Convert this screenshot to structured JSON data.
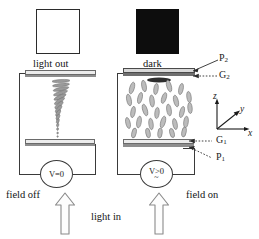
{
  "diagram": {
    "title_semantic": "twisted-nematic-liquid-crystal-cell-field-off-vs-field-on",
    "panels": [
      {
        "id": "left",
        "state_label": "field off",
        "output_label": "light out",
        "output_swatch": "white",
        "voltage_label": "V=0",
        "ac_symbol": "",
        "director_mode": "twisted-helix"
      },
      {
        "id": "right",
        "state_label": "field on",
        "output_label": "dark",
        "output_swatch": "black",
        "voltage_label": "V>0",
        "ac_symbol": "~",
        "director_mode": "vertical-aligned"
      }
    ],
    "input_label": "light in",
    "leader_labels": {
      "top_polarizer": "P",
      "top_polarizer_sub": "2",
      "top_glass": "G",
      "top_glass_sub": "2",
      "bottom_glass": "G",
      "bottom_glass_sub": "1",
      "bottom_polarizer": "P",
      "bottom_polarizer_sub": "1"
    },
    "axes": {
      "z": "z",
      "y": "y",
      "x": "x"
    },
    "colors": {
      "ink": "#1a1a1a",
      "wire": "#3a3a3a",
      "glass_fill": "#ececec",
      "polarizer_fill": "#8e8e8e",
      "dark_swatch": "#0d0d0d",
      "light_swatch": "#ffffff",
      "director_stroke": "#6e6e6e",
      "arrow_stroke": "#7a7a7a"
    }
  }
}
